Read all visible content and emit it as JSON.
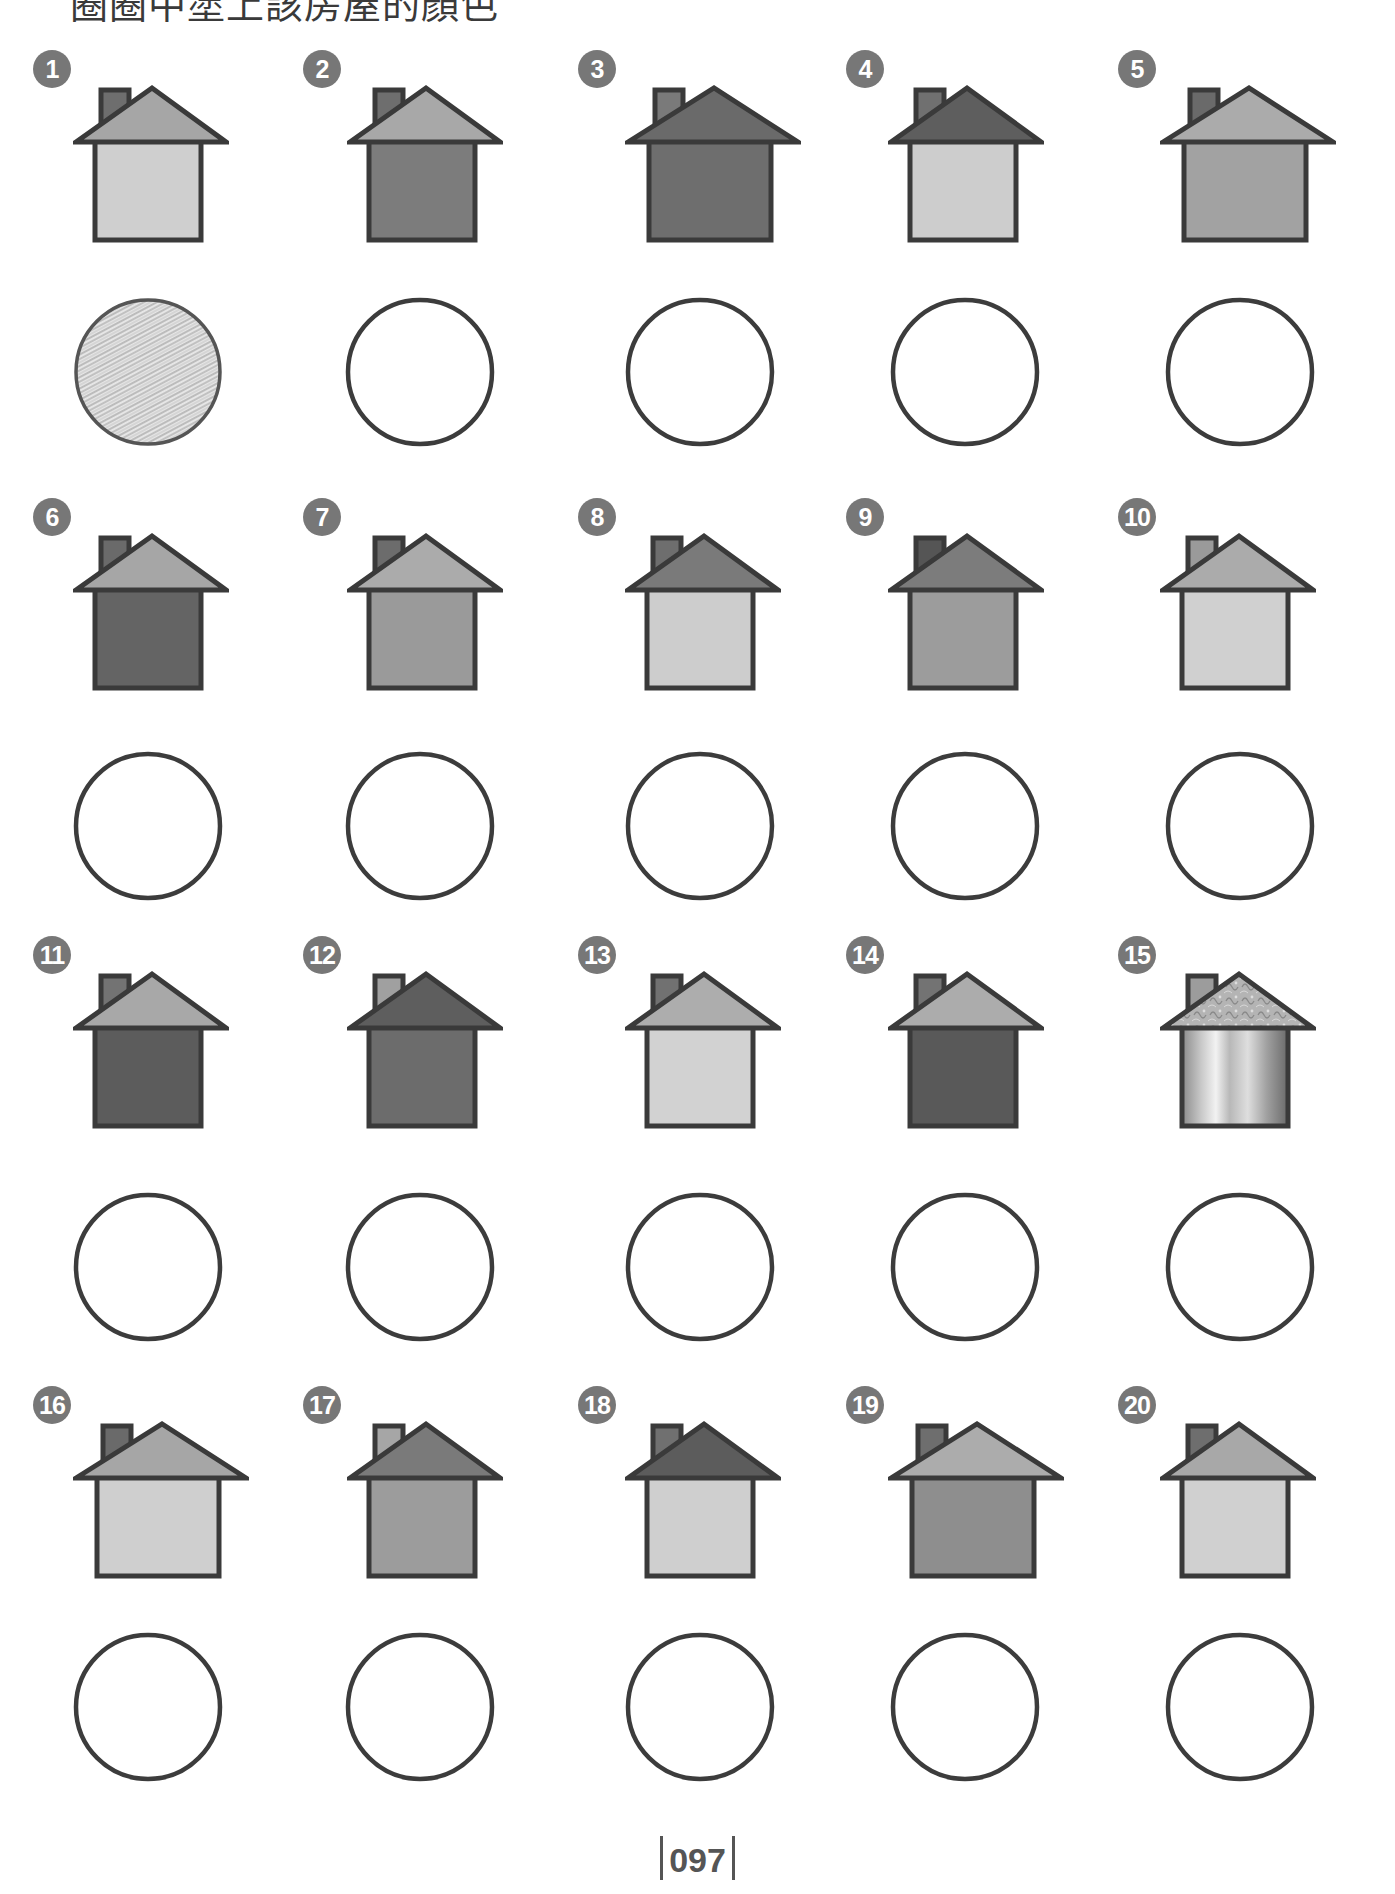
{
  "instruction": "圈圈中塗上該房屋的顏色",
  "page_number": "097",
  "palette": {
    "outline": "#3a3a3a",
    "badge": "#777777",
    "light": "#cfcfcf",
    "medium_light": "#a9a9a9",
    "medium": "#8f8f8f",
    "medium_dark": "#737373",
    "dark": "#5e5e5e",
    "chimney": "#6e6e6e"
  },
  "houses": [
    {
      "number": "1",
      "roof": "#a6a6a6",
      "body": "#cfcfcf",
      "chimney": "#6e6e6e",
      "circle": "scribbled"
    },
    {
      "number": "2",
      "roof": "#a8a8a8",
      "body": "#7c7c7c",
      "chimney": "#6e6e6e",
      "circle": "empty"
    },
    {
      "number": "3",
      "roof": "#6a6a6a",
      "body": "#6e6e6e",
      "chimney": "#7a7a7a",
      "circle": "empty"
    },
    {
      "number": "4",
      "roof": "#5e5e5e",
      "body": "#cdcdcd",
      "chimney": "#707070",
      "circle": "empty"
    },
    {
      "number": "5",
      "roof": "#ababab",
      "body": "#a2a2a2",
      "chimney": "#6a6a6a",
      "circle": "empty"
    },
    {
      "number": "6",
      "roof": "#a6a6a6",
      "body": "#646464",
      "chimney": "#6a6a6a",
      "circle": "empty"
    },
    {
      "number": "7",
      "roof": "#ababab",
      "body": "#9a9a9a",
      "chimney": "#6c6c6c",
      "circle": "empty"
    },
    {
      "number": "8",
      "roof": "#7a7a7a",
      "body": "#cdcdcd",
      "chimney": "#6e6e6e",
      "circle": "empty"
    },
    {
      "number": "9",
      "roof": "#7c7c7c",
      "body": "#9c9c9c",
      "chimney": "#555555",
      "circle": "empty"
    },
    {
      "number": "10",
      "roof": "#ababab",
      "body": "#d0d0d0",
      "chimney": "#9a9a9a",
      "circle": "empty"
    },
    {
      "number": "11",
      "roof": "#a8a8a8",
      "body": "#5c5c5c",
      "chimney": "#737373",
      "circle": "empty"
    },
    {
      "number": "12",
      "roof": "#5e5e5e",
      "body": "#6c6c6c",
      "chimney": "#a0a0a0",
      "circle": "empty"
    },
    {
      "number": "13",
      "roof": "#adadad",
      "body": "#d2d2d2",
      "chimney": "#717171",
      "circle": "empty"
    },
    {
      "number": "14",
      "roof": "#acacac",
      "body": "#595959",
      "chimney": "#737373",
      "circle": "empty"
    },
    {
      "number": "15",
      "roof": "patterned",
      "body": "metallic-gradient",
      "chimney": "#9c9c9c",
      "circle": "empty"
    },
    {
      "number": "16",
      "roof": "#a6a6a6",
      "body": "#cfcfcf",
      "chimney": "#6a6a6a",
      "circle": "empty"
    },
    {
      "number": "17",
      "roof": "#7a7a7a",
      "body": "#9c9c9c",
      "chimney": "#a6a6a6",
      "circle": "empty"
    },
    {
      "number": "18",
      "roof": "#5c5c5c",
      "body": "#cfcfcf",
      "chimney": "#707070",
      "circle": "empty"
    },
    {
      "number": "19",
      "roof": "#acacac",
      "body": "#8e8e8e",
      "chimney": "#6e6e6e",
      "circle": "empty"
    },
    {
      "number": "20",
      "roof": "#a8a8a8",
      "body": "#d0d0d0",
      "chimney": "#6e6e6e",
      "circle": "empty"
    }
  ]
}
